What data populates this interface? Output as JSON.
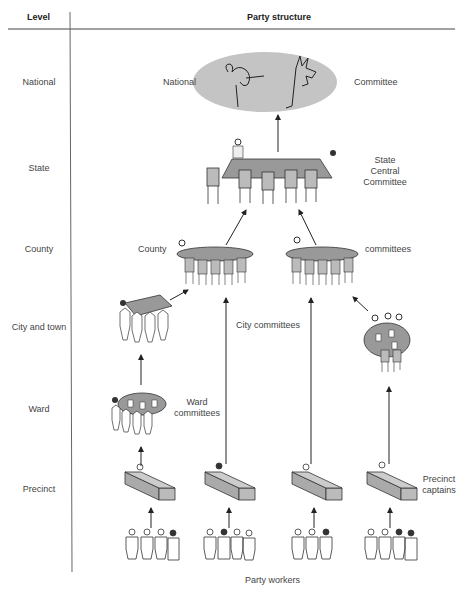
{
  "header": {
    "level_col": "Level",
    "structure_col": "Party structure"
  },
  "levels": [
    {
      "label": "National"
    },
    {
      "label": "State"
    },
    {
      "label": "County"
    },
    {
      "label": "City and town"
    },
    {
      "label": "Ward"
    },
    {
      "label": "Precinct"
    }
  ],
  "labels": {
    "national_left": "National",
    "national_right": "Committee",
    "state_1": "State",
    "state_2": "Central",
    "state_3": "Committee",
    "county_left": "County",
    "county_right": "committees",
    "city": "City committees",
    "ward_1": "Ward",
    "ward_2": "committees",
    "precinct_1": "Precinct",
    "precinct_2": "captains",
    "workers": "Party workers"
  },
  "icons": {
    "national": [
      "elephant-icon",
      "donkey-icon"
    ],
    "colors": {
      "fill": "#c4c4c4",
      "stroke": "#222222"
    }
  }
}
